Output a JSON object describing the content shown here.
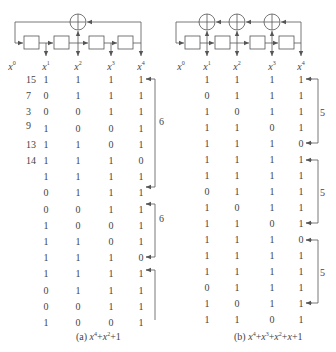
{
  "panels": [
    {
      "id": "a",
      "polynomial_caption": "(a) x⁴+x²+1",
      "caption_prefix": "(a)",
      "caption_terms": [
        {
          "base": "x",
          "exp": "4"
        },
        {
          "op": "+"
        },
        {
          "base": "x",
          "exp": "2"
        },
        {
          "op": "+1"
        }
      ],
      "tap_labels": [
        "x0",
        "x1",
        "x2",
        "x3",
        "x4"
      ],
      "xor_count": 1,
      "row_labels": [
        "15",
        "7",
        "3",
        "9",
        "13",
        "14"
      ],
      "rows": [
        [
          1,
          1,
          1,
          1
        ],
        [
          0,
          1,
          1,
          1
        ],
        [
          0,
          0,
          1,
          1
        ],
        [
          1,
          0,
          0,
          1
        ],
        [
          1,
          1,
          0,
          1
        ],
        [
          1,
          1,
          1,
          0
        ],
        [
          1,
          1,
          1,
          1
        ],
        [
          0,
          1,
          1,
          1
        ],
        [
          0,
          0,
          1,
          1
        ],
        [
          1,
          0,
          0,
          1
        ],
        [
          1,
          1,
          0,
          1
        ],
        [
          1,
          1,
          1,
          0
        ],
        [
          1,
          1,
          1,
          1
        ],
        [
          0,
          1,
          1,
          1
        ],
        [
          0,
          0,
          1,
          1
        ],
        [
          1,
          0,
          0,
          1
        ]
      ],
      "periods": [
        {
          "label": "6",
          "from_row": 0,
          "to_row": 5
        },
        {
          "label": "6",
          "from_row": 6,
          "to_row": 11
        },
        {
          "label": "",
          "from_row": 12,
          "to_row": 15
        }
      ]
    },
    {
      "id": "b",
      "polynomial_caption": "(b) x⁴+x³+x²+x+1",
      "caption_prefix": "(b)",
      "caption_terms": [
        {
          "base": "x",
          "exp": "4"
        },
        {
          "op": "+"
        },
        {
          "base": "x",
          "exp": "3"
        },
        {
          "op": "+"
        },
        {
          "base": "x",
          "exp": "2"
        },
        {
          "op": "+"
        },
        {
          "base": "x",
          "exp": ""
        },
        {
          "op": "+1"
        }
      ],
      "tap_labels": [
        "x0",
        "x1",
        "x2",
        "x3",
        "x4"
      ],
      "xor_count": 3,
      "rows": [
        [
          1,
          1,
          1,
          1
        ],
        [
          0,
          1,
          1,
          1
        ],
        [
          1,
          0,
          1,
          1
        ],
        [
          1,
          1,
          0,
          1
        ],
        [
          1,
          1,
          1,
          0
        ],
        [
          1,
          1,
          1,
          1
        ],
        [
          1,
          1,
          1,
          1
        ],
        [
          0,
          1,
          1,
          1
        ],
        [
          1,
          0,
          1,
          1
        ],
        [
          1,
          1,
          0,
          1
        ],
        [
          1,
          1,
          1,
          0
        ],
        [
          1,
          1,
          1,
          1
        ],
        [
          1,
          1,
          1,
          1
        ],
        [
          0,
          1,
          1,
          1
        ],
        [
          1,
          0,
          1,
          1
        ],
        [
          1,
          1,
          0,
          1
        ]
      ],
      "periods": [
        {
          "label": "5",
          "from_row": 0,
          "to_row": 4
        },
        {
          "label": "5",
          "from_row": 5,
          "to_row": 9
        },
        {
          "label": "5",
          "from_row": 10,
          "to_row": 14
        }
      ]
    }
  ]
}
